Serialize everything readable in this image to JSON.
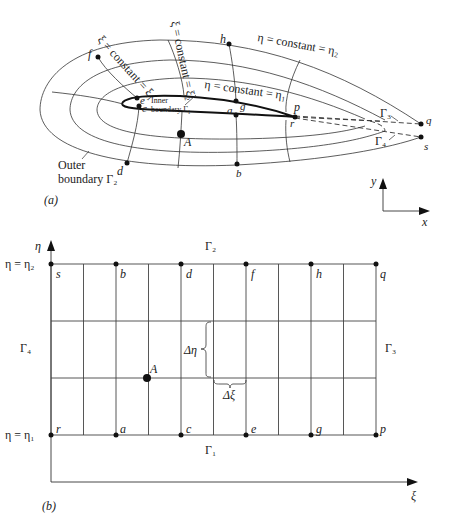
{
  "panel_a": {
    "caption": "(a)",
    "labels": {
      "xi_const_1": "ξ = constant = ξ₁",
      "xi_const_2": "ξ = constant = ξ₂",
      "eta_const_2": "η = constant = η₂",
      "eta_const_1": "η = constant = η₁",
      "inner_boundary_line1": "Inner",
      "inner_boundary_line2": "boundary Γ₁",
      "outer_boundary_line1": "Outer",
      "outer_boundary_line2": "boundary Γ₂",
      "gamma3": "Γ₃",
      "gamma4": "Γ₄"
    },
    "points": {
      "f": "f",
      "h": "h",
      "e": "e",
      "c": "c",
      "g": "g",
      "a": "a",
      "p": "p",
      "r": "r",
      "A": "A",
      "d": "d",
      "b": "b",
      "q": "q",
      "s": "s"
    },
    "axes": {
      "x": "x",
      "y": "y"
    }
  },
  "panel_b": {
    "caption": "(b)",
    "axis_eta": "η",
    "axis_xi": "ξ",
    "eta2_label": "η = η₂",
    "eta1_label": "η = η₁",
    "gamma1": "Γ₁",
    "gamma2": "Γ₂",
    "gamma3": "Γ₃",
    "gamma4": "Γ₄",
    "delta_eta": "Δη",
    "delta_xi": "Δξ",
    "top_points": [
      "s",
      "b",
      "d",
      "f",
      "h",
      "q"
    ],
    "bottom_points": [
      "r",
      "a",
      "c",
      "e",
      "g",
      "p"
    ],
    "point_A": "A",
    "grid": {
      "columns": 10,
      "rows": 3
    }
  }
}
